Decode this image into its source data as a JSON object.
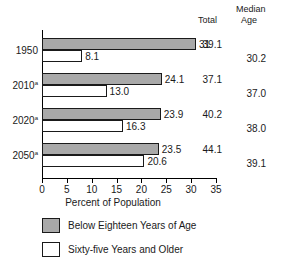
{
  "headers": {
    "median": "Median",
    "total": "Total",
    "age": "Age"
  },
  "legend": {
    "items": [
      {
        "label": "Below Eighteen Years of Age",
        "swatch": "gray"
      },
      {
        "label": "Sixty-five Years and Older",
        "swatch": "white"
      }
    ]
  },
  "colors": {
    "bar_gray": "#a9a9a9",
    "bar_white": "#ffffff",
    "outline": "#1a1a1a"
  },
  "chart_data": {
    "type": "bar",
    "orientation": "horizontal",
    "title": "",
    "xlabel": "Percent of Population",
    "ylabel": "",
    "xlim": [
      0,
      35
    ],
    "xticks": [
      0,
      5,
      10,
      15,
      20,
      25,
      30,
      35
    ],
    "xtick_labels": [
      "0",
      "5",
      "10",
      "15",
      "20",
      "25",
      "30",
      "35"
    ],
    "grid": false,
    "legend_position": "bottom-left",
    "categories": [
      "1950",
      "2010",
      "2020",
      "2050"
    ],
    "category_labels": [
      "1950",
      "2010a",
      "2020a",
      "2050a"
    ],
    "category_superscripts": [
      "",
      "a",
      "a",
      "a"
    ],
    "series": [
      {
        "name": "Below Eighteen Years of Age",
        "color": "#a9a9a9",
        "values": [
          31.0,
          24.1,
          23.9,
          23.5
        ],
        "value_labels": [
          "31",
          "24.1",
          "23.9",
          "23.5"
        ]
      },
      {
        "name": "Sixty-five Years and Older",
        "color": "#ffffff",
        "values": [
          8.1,
          13.0,
          16.3,
          20.6
        ],
        "value_labels": [
          "8.1",
          "13.0",
          "16.3",
          "20.6"
        ]
      }
    ],
    "annotation_columns": [
      {
        "name": "Total",
        "header": "Total",
        "values": [
          "39.1",
          "37.1",
          "40.2",
          "44.1"
        ]
      },
      {
        "name": "Median Age",
        "header": "Median Age",
        "values": [
          "30.2",
          "37.0",
          "38.0",
          "39.1"
        ]
      }
    ]
  }
}
